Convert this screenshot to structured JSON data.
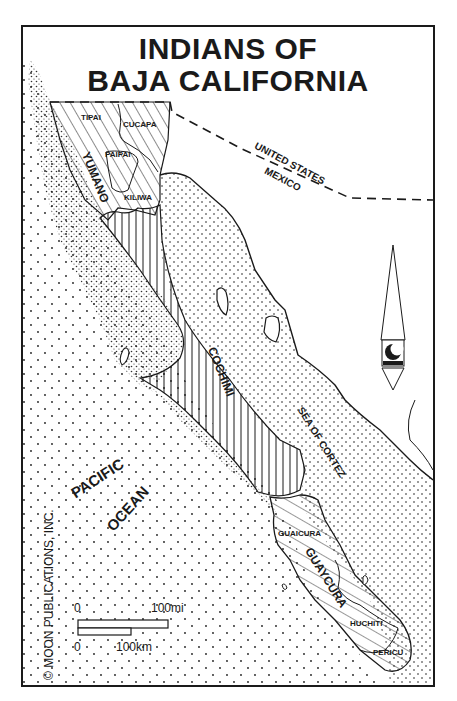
{
  "map": {
    "title_line1": "INDIANS OF",
    "title_line2": "BAJA CALIFORNIA",
    "groups": {
      "yumano": "YUMANO",
      "cochimi": "COCHIMI",
      "guaycura": "GUAYCURA"
    },
    "subgroups": {
      "tipai": "TIPAI",
      "cucapa": "CUCAPA",
      "paipai": "PAIPAI",
      "kiliwa": "KILIWA",
      "guaicura": "GUAICURA",
      "huchiti": "HUCHITI",
      "pericu": "PERICU"
    },
    "water": {
      "pacific": "PACIFIC",
      "ocean": "OCEAN",
      "sea_of_cortez": "SEA OF CORTEZ"
    },
    "border": {
      "north": "UNITED STATES",
      "south": "MEXICO"
    },
    "scale": {
      "mi_zero": "0",
      "mi_max": "100mi",
      "km_zero": "0",
      "km_max": "100km"
    },
    "copyright": "© MOON PUBLICATIONS, INC.",
    "compass": "north-arrow-with-moon-logo",
    "colors": {
      "ink": "#1a1a1a",
      "paper": "#ffffff"
    }
  }
}
